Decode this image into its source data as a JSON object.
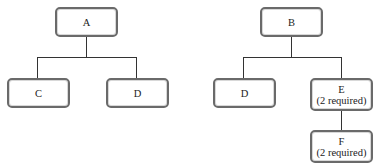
{
  "diagram": {
    "type": "tree",
    "trees": [
      {
        "root": {
          "id": "A",
          "label": "A"
        },
        "children": [
          {
            "id": "C",
            "label": "C"
          },
          {
            "id": "D1",
            "label": "D"
          }
        ]
      },
      {
        "root": {
          "id": "B",
          "label": "B"
        },
        "children": [
          {
            "id": "D2",
            "label": "D"
          },
          {
            "id": "E",
            "label": "E",
            "note": "(2 required)",
            "children": [
              {
                "id": "F",
                "label": "F",
                "note": "(2 required)"
              }
            ]
          }
        ]
      }
    ]
  },
  "nodes": {
    "A": {
      "label": "A"
    },
    "C": {
      "label": "C"
    },
    "D1": {
      "label": "D"
    },
    "B": {
      "label": "B"
    },
    "D2": {
      "label": "D"
    },
    "E": {
      "label": "E",
      "note": "(2 required)"
    },
    "F": {
      "label": "F",
      "note": "(2 required)"
    }
  }
}
